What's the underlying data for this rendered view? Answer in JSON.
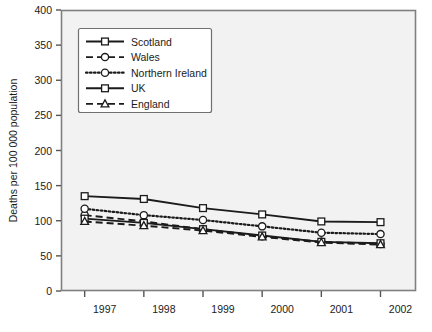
{
  "chart_data": {
    "type": "line",
    "title": "",
    "subtitle": "",
    "xlabel": "",
    "ylabel": "Deaths per 100 000 population",
    "categories": [
      "1997",
      "1998",
      "1999",
      "2000",
      "2001",
      "2002"
    ],
    "x": [
      1997,
      1998,
      1999,
      2000,
      2001,
      2002
    ],
    "xlim": [
      1996.6,
      2002.6
    ],
    "ylim": [
      0,
      400
    ],
    "yticks": [
      0,
      50,
      100,
      150,
      200,
      250,
      300,
      350,
      400
    ],
    "ytick_labels": [
      "0",
      "50",
      "100",
      "150",
      "200",
      "250",
      "300",
      "350",
      "400"
    ],
    "xticks": [
      1997,
      1998,
      1999,
      2000,
      2001,
      2002
    ],
    "xtick_labels": [
      "1997",
      "1998",
      "1999",
      "2000",
      "2001",
      "2002"
    ],
    "grid": false,
    "legend_position": "upper-left-inside",
    "series": [
      {
        "name": "Scotland",
        "values": [
          135,
          131,
          118,
          109,
          99,
          98
        ],
        "line_style": "solid",
        "marker": "square",
        "color": "#1b1b1b"
      },
      {
        "name": "Wales",
        "values": [
          108,
          99,
          88,
          78,
          70,
          67
        ],
        "line_style": "dashed",
        "marker": "circle",
        "color": "#1b1b1b"
      },
      {
        "name": "Northern Ireland",
        "values": [
          117,
          108,
          101,
          92,
          83,
          81
        ],
        "line_style": "dotted",
        "marker": "circle",
        "color": "#1b1b1b"
      },
      {
        "name": "UK",
        "values": [
          103,
          97,
          88,
          79,
          70,
          68
        ],
        "line_style": "solid",
        "marker": "square",
        "color": "#1b1b1b"
      },
      {
        "name": "England",
        "values": [
          99,
          93,
          86,
          77,
          69,
          66
        ],
        "line_style": "dashed",
        "marker": "triangle",
        "color": "#1b1b1b"
      }
    ],
    "colors": {
      "axis": "#555555",
      "plot_background": "#f2f2f2",
      "figure_background": "#ffffff",
      "line": "#1b1b1b"
    }
  }
}
